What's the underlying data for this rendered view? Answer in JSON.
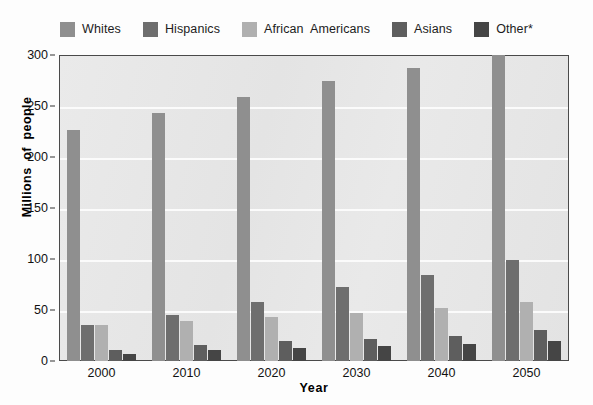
{
  "chart_data": {
    "type": "bar",
    "title": "",
    "xlabel": "Year",
    "ylabel": "Millions  of  people",
    "categories": [
      "2000",
      "2010",
      "2020",
      "2030",
      "2040",
      "2050"
    ],
    "ylim": [
      0,
      300
    ],
    "ytick_step": 50,
    "yticks": [
      "0",
      "50",
      "100",
      "150",
      "200",
      "250",
      "300"
    ],
    "grid": true,
    "legend_position": "top",
    "series": [
      {
        "name": "Whites",
        "color": "#8f8f8f",
        "values": [
          226,
          243,
          259,
          275,
          287,
          300
        ]
      },
      {
        "name": "Hispanics",
        "color": "#6e6e6e",
        "values": [
          35,
          45,
          58,
          73,
          84,
          99
        ]
      },
      {
        "name": "African  Americans",
        "color": "#b0b0b0",
        "values": [
          35,
          39,
          43,
          47,
          52,
          58
        ]
      },
      {
        "name": "Asians",
        "color": "#5e5e5e",
        "values": [
          11,
          16,
          20,
          22,
          25,
          30
        ]
      },
      {
        "name": "Other*",
        "color": "#454545",
        "values": [
          7,
          11,
          13,
          15,
          17,
          20
        ]
      }
    ]
  },
  "colors": {
    "plot_background": "#e7e7e7",
    "gridline": "#fbfbfb",
    "axis": "#4a4a4a",
    "text": "#111111"
  },
  "footnote": ""
}
